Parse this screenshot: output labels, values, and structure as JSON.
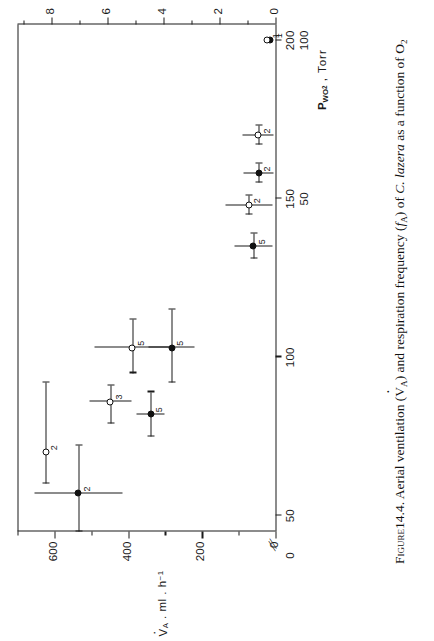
{
  "figure": {
    "number": "14.4",
    "caption_prefix": "Figure",
    "caption_text": "Aerial ventilation (V̇A) and respiration frequency (fA) of C. lazera as a function of O2",
    "species": "C. lazera",
    "caption_part1": "14.4. Aerial ventilation (",
    "caption_va": "V",
    "caption_va_sub": "A",
    "caption_part2": ") and respiration frequency (",
    "caption_fa": "f",
    "caption_fa_sub": "A",
    "caption_part3": ") of ",
    "caption_part4": " as a function of O",
    "caption_o2_sub": "2"
  },
  "chart_data": {
    "type": "scatter",
    "title": "",
    "xlabel": "PWO2 , Torr",
    "xlabel_main": "P",
    "xlabel_sub": "WO",
    "xlabel_sub2": "2",
    "xlabel_units": ", Torr",
    "x_axis": {
      "label": "PWO2 . Torr",
      "broken": true,
      "break_symbol": "//",
      "outer_scale_ticks": [
        50,
        100,
        150,
        200
      ],
      "inner_scale_ticks": [
        50,
        100
      ],
      "origin_label": "0",
      "range": [
        45,
        205
      ]
    },
    "y_axes": [
      {
        "name": "VA",
        "label": "VA . ml . h-1",
        "label_v": "V",
        "label_sub": "A",
        "label_units": ". ml . h",
        "label_exp": "-1",
        "ticks": [
          0,
          200,
          400,
          600
        ],
        "minor_ticks": [
          100,
          300,
          500,
          700
        ],
        "range": [
          0,
          700
        ],
        "marker": "filled-circle",
        "position": "left"
      },
      {
        "name": "fA",
        "label": "fA h-1",
        "label_f": "f",
        "label_sub": "A",
        "label_units": "h",
        "label_exp": "-1",
        "ticks": [
          0,
          2,
          4,
          6,
          8
        ],
        "minor_ticks": [
          1,
          3,
          5,
          7,
          9
        ],
        "range": [
          0,
          9.2
        ],
        "marker": "open-circle",
        "position": "right"
      }
    ],
    "series": [
      {
        "name": "Aerial ventilation (VA)",
        "marker": "filled-circle",
        "yaxis": "VA",
        "units": "ml . h-1",
        "points": [
          {
            "x": 57,
            "y": 535,
            "n": "2",
            "xerr_low": 12,
            "xerr_high": 15,
            "yerr": 120
          },
          {
            "x": 82,
            "y": 338,
            "n": "5",
            "xerr_low": 7,
            "xerr_high": 7,
            "yerr": 38
          },
          {
            "x": 103,
            "y": 282,
            "n": "5",
            "xerr_low": 11,
            "xerr_high": 12,
            "yerr": 62
          },
          {
            "x": 135,
            "y": 60,
            "n": "5",
            "xerr_low": 4,
            "xerr_high": 4,
            "yerr": 52
          },
          {
            "x": 158,
            "y": 46,
            "n": "2",
            "xerr_low": 3,
            "xerr_high": 3,
            "yerr": 40
          },
          {
            "x": 200,
            "y": 14,
            "n": "1",
            "xerr_low": 0,
            "xerr_high": 0,
            "yerr": 0
          }
        ]
      },
      {
        "name": "Respiration frequency (fA)",
        "marker": "open-circle",
        "yaxis": "fA",
        "units": "h-1",
        "points": [
          {
            "x": 70,
            "y": 8.2,
            "n": "2",
            "xerr_low": 10,
            "xerr_high": 22,
            "yerr": 0.0
          },
          {
            "x": 86,
            "y": 5.9,
            "n": "3",
            "xerr_low": 7,
            "xerr_high": 5,
            "yerr": 0.75
          },
          {
            "x": 103,
            "y": 5.1,
            "n": "5",
            "xerr_low": 8,
            "xerr_high": 9,
            "yerr": 1.35
          },
          {
            "x": 148,
            "y": 0.95,
            "n": "2",
            "xerr_low": 3,
            "xerr_high": 3,
            "yerr": 0.85
          },
          {
            "x": 170,
            "y": 0.62,
            "n": "2",
            "xerr_low": 3,
            "xerr_high": 3,
            "yerr": 0.55
          },
          {
            "x": 200,
            "y": 0.3,
            "n": "1",
            "xerr_low": 0,
            "xerr_high": 0,
            "yerr": 0
          }
        ]
      }
    ],
    "grid": false,
    "legend": "none"
  },
  "axis_labels": {
    "fa_axis_ticks": [
      "8",
      "6",
      "4",
      "2",
      "0"
    ],
    "va_axis_ticks": [
      "600",
      "400",
      "200",
      "0"
    ],
    "pwo2_outer_ticks": [
      "50",
      "100",
      "150",
      "200"
    ],
    "pwo2_inner_ticks": [
      "50",
      "100"
    ],
    "pwo2_zero": "0"
  },
  "colors": {
    "ink": "#1a1a1a",
    "background": "#ffffff"
  }
}
